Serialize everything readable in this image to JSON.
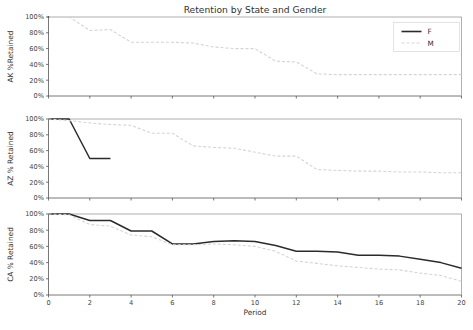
{
  "chart_data": {
    "type": "line",
    "title": "Retention by State and Gender",
    "xlabel": "Period",
    "xlim": [
      0,
      20
    ],
    "ylim": [
      0,
      100
    ],
    "grid": false,
    "legend_position": "upper-right",
    "legend_entries": [
      {
        "name": "F",
        "style": "solid",
        "color": "#2b2b2b"
      },
      {
        "name": "M",
        "style": "dashed",
        "color": "#d4d4d4"
      }
    ],
    "xticks": [
      0,
      2,
      4,
      6,
      8,
      10,
      12,
      14,
      16,
      18,
      20
    ],
    "xticklabels": [
      "0",
      "2",
      "4",
      "6",
      "8",
      "10",
      "12",
      "14",
      "16",
      "18",
      "20"
    ],
    "yticks": [
      0,
      20,
      40,
      60,
      80,
      100
    ],
    "yticklabels": [
      "0%",
      "20%",
      "40%",
      "60%",
      "80%",
      "100%"
    ],
    "panels": [
      {
        "id": "AK",
        "ylabel": "AK %Retained",
        "series": [
          {
            "name": "F",
            "x": [
              0
            ],
            "values": [
              100
            ]
          },
          {
            "name": "M",
            "x": [
              0,
              1,
              2,
              3,
              4,
              5,
              6,
              7,
              8,
              9,
              10,
              11,
              12,
              13,
              14,
              15,
              16,
              17,
              18,
              19,
              20
            ],
            "values": [
              100,
              100,
              83,
              84,
              68,
              68,
              68,
              67,
              62,
              60,
              60,
              44,
              43,
              28,
              27,
              27,
              27,
              27,
              27,
              27,
              27
            ]
          }
        ]
      },
      {
        "id": "AZ",
        "ylabel": "AZ % Retained",
        "series": [
          {
            "name": "F",
            "x": [
              0,
              1,
              2,
              3
            ],
            "values": [
              100,
              100,
              50,
              50
            ]
          },
          {
            "name": "M",
            "x": [
              0,
              1,
              2,
              3,
              4,
              5,
              6,
              7,
              8,
              9,
              10,
              11,
              12,
              13,
              14,
              15,
              16,
              17,
              18,
              19,
              20
            ],
            "values": [
              100,
              98,
              95,
              93,
              92,
              82,
              82,
              66,
              64,
              63,
              58,
              53,
              53,
              36,
              35,
              34,
              34,
              33,
              33,
              32,
              32
            ]
          }
        ]
      },
      {
        "id": "CA",
        "ylabel": "CA % Retained",
        "series": [
          {
            "name": "F",
            "x": [
              0,
              1,
              2,
              3,
              4,
              5,
              6,
              7,
              8,
              9,
              10,
              11,
              12,
              13,
              14,
              15,
              16,
              17,
              18,
              19,
              20
            ],
            "values": [
              100,
              100,
              92,
              92,
              79,
              79,
              63,
              63,
              66,
              67,
              66,
              61,
              54,
              54,
              53,
              49,
              49,
              48,
              44,
              40,
              33
            ]
          },
          {
            "name": "M",
            "x": [
              0,
              1,
              2,
              3,
              4,
              5,
              6,
              7,
              8,
              9,
              10,
              11,
              12,
              13,
              14,
              15,
              16,
              17,
              18,
              19,
              20
            ],
            "values": [
              100,
              99,
              87,
              85,
              74,
              72,
              62,
              62,
              63,
              62,
              60,
              54,
              42,
              39,
              36,
              34,
              32,
              31,
              27,
              24,
              17
            ]
          }
        ]
      }
    ]
  },
  "figure": {
    "background": "#ffffff"
  }
}
